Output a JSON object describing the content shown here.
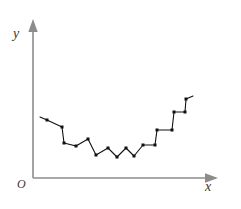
{
  "figure": {
    "title": "",
    "background_color": "#ffffff",
    "width": 241,
    "height": 209
  },
  "axes": {
    "color": "#8c8c8c",
    "origin_label": "O",
    "x_axis": {
      "label": "x",
      "name": "x-axis",
      "arrow": true,
      "start": [
        33,
        178
      ],
      "end": [
        218,
        178
      ]
    },
    "y_axis": {
      "label": "y",
      "name": "y-axis",
      "arrow": true,
      "start": [
        33,
        178
      ],
      "end": [
        33,
        22
      ]
    }
  },
  "chart_data": {
    "type": "line",
    "title": "",
    "xlabel": "x",
    "ylabel": "y",
    "grid": false,
    "legend": false,
    "marker": "square",
    "marker_color": "#111111",
    "line_color": "#111111",
    "axis_arrows": true,
    "points_px": [
      [
        47,
        120
      ],
      [
        62,
        127
      ],
      [
        64,
        143
      ],
      [
        76,
        146
      ],
      [
        88,
        139
      ],
      [
        96,
        155
      ],
      [
        108,
        148
      ],
      [
        117,
        157
      ],
      [
        126,
        148
      ],
      [
        134,
        156
      ],
      [
        143,
        145
      ],
      [
        155,
        145
      ],
      [
        157,
        130
      ],
      [
        172,
        130
      ],
      [
        174,
        112
      ],
      [
        185,
        112
      ],
      [
        186,
        99
      ]
    ],
    "x": [
      47,
      62,
      64,
      76,
      88,
      96,
      108,
      117,
      126,
      134,
      143,
      155,
      157,
      172,
      174,
      185,
      186
    ],
    "values": [
      58,
      51,
      35,
      32,
      39,
      23,
      31,
      21,
      31,
      22,
      33,
      33,
      48,
      48,
      66,
      66,
      79
    ],
    "ylim": [
      0,
      160
    ],
    "xlim": [
      33,
      218
    ]
  }
}
